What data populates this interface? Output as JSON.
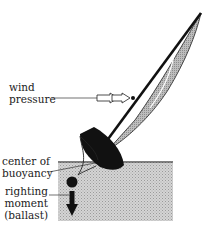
{
  "diagram": {
    "labels": {
      "wind_pressure_line1": "wind",
      "wind_pressure_line2": "pressure",
      "buoyancy_line1": "center of",
      "buoyancy_line2": "buoyancy",
      "righting_line1": "righting",
      "righting_line2": "moment",
      "righting_line3": "(ballast)"
    },
    "colors": {
      "ink": "#111111",
      "water": "#c8c8c8",
      "sail": "#b8b8b8",
      "background": "#ffffff"
    }
  }
}
